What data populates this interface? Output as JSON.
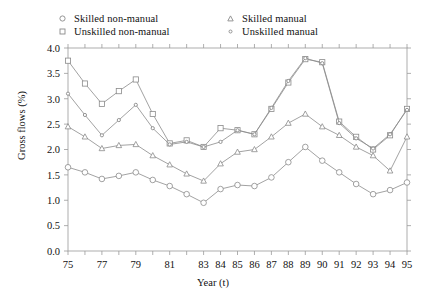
{
  "chart_data": {
    "type": "line",
    "title": "",
    "xlabel": "Year (t)",
    "ylabel": "Gross flows (%)",
    "xlim": [
      75,
      95
    ],
    "ylim": [
      0.0,
      4.0
    ],
    "ytick_step": 0.5,
    "grid": false,
    "legend_position": "top",
    "x": [
      75,
      76,
      77,
      78,
      79,
      80,
      81,
      82,
      83,
      84,
      85,
      86,
      87,
      88,
      89,
      90,
      91,
      92,
      93,
      94,
      95
    ],
    "xtick_labels": [
      "75",
      "",
      "77",
      "",
      "79",
      "",
      "81",
      "",
      "83",
      "84",
      "85",
      "86",
      "87",
      "88",
      "89",
      "90",
      "91",
      "92",
      "93",
      "94",
      "95"
    ],
    "ytick_labels": [
      "0.0",
      "0.5",
      "1.0",
      "1.5",
      "2.0",
      "2.5",
      "3.0",
      "3.5",
      "4.0"
    ],
    "series": [
      {
        "name": "Skilled non-manual",
        "marker": "circle",
        "values": [
          1.65,
          1.55,
          1.42,
          1.48,
          1.55,
          1.4,
          1.28,
          1.12,
          0.95,
          1.22,
          1.3,
          1.28,
          1.45,
          1.75,
          2.05,
          1.78,
          1.55,
          1.32,
          1.12,
          1.2,
          1.35
        ]
      },
      {
        "name": "Unskilled non-manual",
        "marker": "square",
        "values": [
          3.75,
          3.3,
          2.9,
          3.15,
          3.38,
          2.7,
          2.12,
          2.18,
          2.05,
          2.42,
          2.38,
          2.3,
          2.8,
          3.32,
          3.78,
          3.72,
          2.55,
          2.25,
          2.0,
          2.28,
          2.8
        ]
      },
      {
        "name": "Skilled manual",
        "marker": "triangle",
        "values": [
          2.45,
          2.25,
          2.02,
          2.08,
          2.1,
          1.88,
          1.7,
          1.52,
          1.38,
          1.72,
          1.95,
          2.0,
          2.25,
          2.52,
          2.7,
          2.45,
          2.28,
          2.05,
          1.88,
          1.58,
          2.25
        ]
      },
      {
        "name": "Unskilled manual",
        "marker": "dot",
        "values": [
          3.1,
          2.68,
          2.28,
          2.58,
          2.88,
          2.42,
          2.1,
          2.15,
          2.05,
          2.15,
          2.38,
          2.3,
          2.82,
          3.35,
          3.8,
          3.7,
          2.52,
          2.22,
          2.02,
          2.3,
          2.78
        ]
      }
    ]
  },
  "legend": {
    "items": [
      {
        "label": "Skilled non-manual",
        "marker": "circle"
      },
      {
        "label": "Skilled manual",
        "marker": "triangle"
      },
      {
        "label": "Unskilled non-manual",
        "marker": "square"
      },
      {
        "label": "Unskilled manual",
        "marker": "dot"
      }
    ]
  },
  "axes": {
    "y_title": "Gross flows (%)",
    "x_title": "Year (t)"
  },
  "colors": {
    "line": "#8a8a8a",
    "axis": "#9a9a9a",
    "text": "#111111",
    "background": "#ffffff"
  }
}
